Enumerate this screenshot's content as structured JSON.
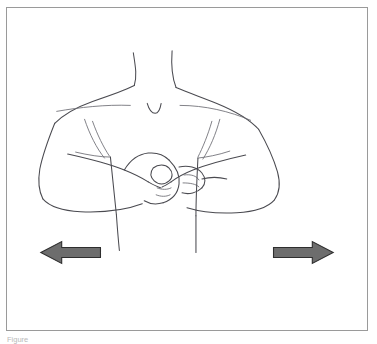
{
  "figure": {
    "panel_name": "exercise-illustration-frame",
    "background_color": "#ffffff",
    "border_color": "#9a9a9a",
    "parts": [
      {
        "name": "neck",
        "label": "neck"
      },
      {
        "name": "left-shoulder",
        "label": "left shoulder"
      },
      {
        "name": "right-shoulder",
        "label": "right shoulder"
      },
      {
        "name": "sternal-notch",
        "label": "sternal notch"
      },
      {
        "name": "left-arm",
        "label": "left arm, elbow bent outward"
      },
      {
        "name": "right-arm",
        "label": "right arm, elbow bent outward"
      },
      {
        "name": "clasped-hands",
        "label": "clasped hands at chest"
      },
      {
        "name": "torso",
        "label": "torso"
      }
    ]
  },
  "arrows": {
    "fill_color": "#6d6d6d",
    "outline_color": "#2e2e2e",
    "items": [
      {
        "name": "left-arrow",
        "direction": "left",
        "label": "pull outward to the left",
        "tip_x": 40,
        "tail_x": 100,
        "center_y": 252
      },
      {
        "name": "right-arrow",
        "direction": "right",
        "label": "pull outward to the right",
        "tip_x": 338,
        "tail_x": 278,
        "center_y": 252
      }
    ]
  },
  "caption": {
    "text": "Figure"
  }
}
